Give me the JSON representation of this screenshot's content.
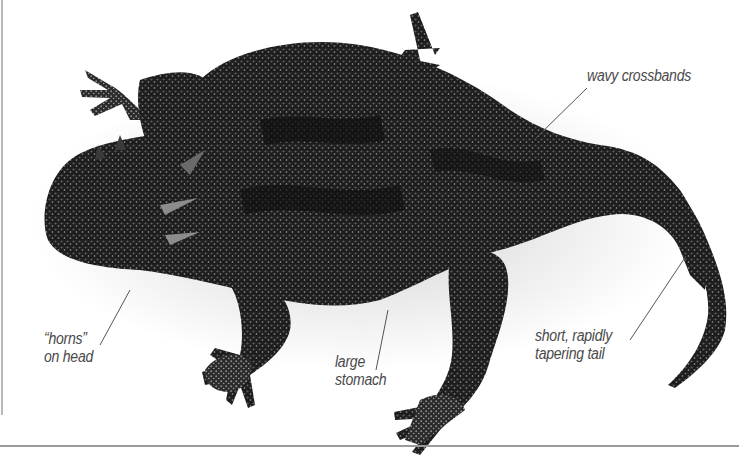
{
  "figure": {
    "colors": {
      "background": "#ffffff",
      "body": "#1c1c1c",
      "body_highlight": "#6e6e6e",
      "label_text": "#4a4a4a",
      "leader_line": "#555555",
      "rule": "#9a9a9a"
    }
  },
  "labels": {
    "crossbands": {
      "lines": [
        "wavy crossbands"
      ]
    },
    "horns": {
      "lines": [
        "“horns”",
        "on head"
      ]
    },
    "stomach": {
      "lines": [
        "large",
        "stomach"
      ]
    },
    "tail": {
      "lines": [
        "short, rapidly",
        "tapering tail"
      ]
    }
  }
}
